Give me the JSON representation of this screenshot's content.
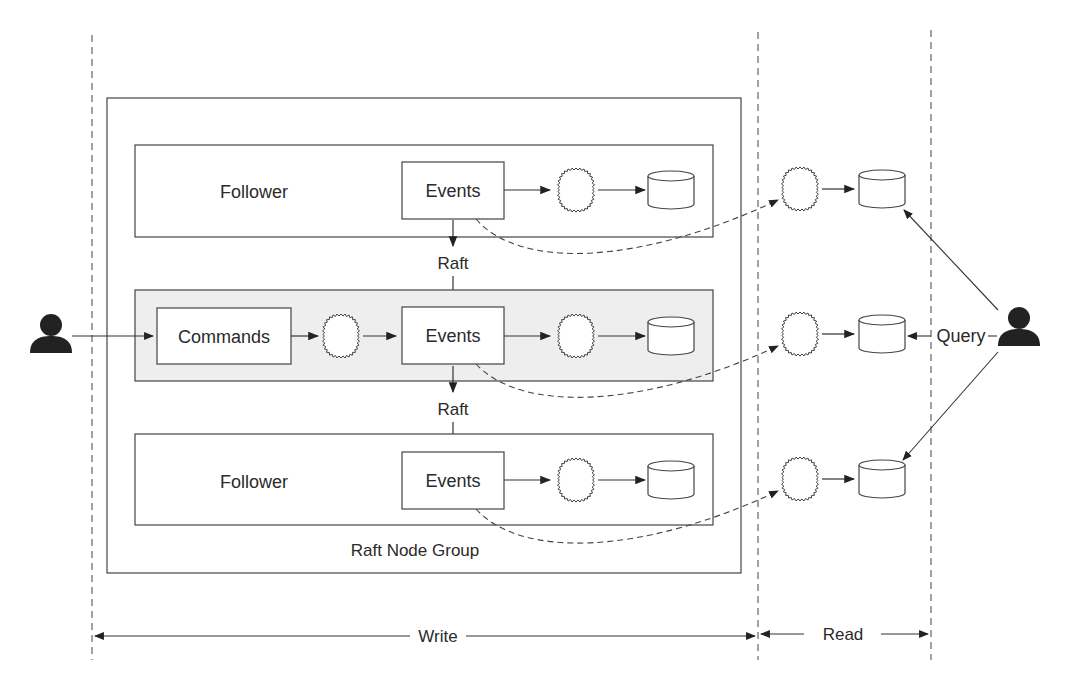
{
  "diagram": {
    "group_label": "Raft Node Group",
    "rows": [
      {
        "role": "Follower",
        "event_label": "Events"
      },
      {
        "role": "Leader",
        "command_label": "Commands",
        "event_label": "Events"
      },
      {
        "role": "Follower",
        "event_label": "Events"
      }
    ],
    "raft_labels": [
      "Raft",
      "Raft"
    ],
    "query_label": "Query",
    "spans": {
      "write": "Write",
      "read": "Read"
    },
    "icons": {
      "writer": "person-icon",
      "reader": "person-icon",
      "processor": "gear-circle-icon",
      "store": "database-icon"
    },
    "colors": {
      "stroke": "#333333",
      "leader_fill": "#eeeeee",
      "background": "#ffffff"
    }
  }
}
